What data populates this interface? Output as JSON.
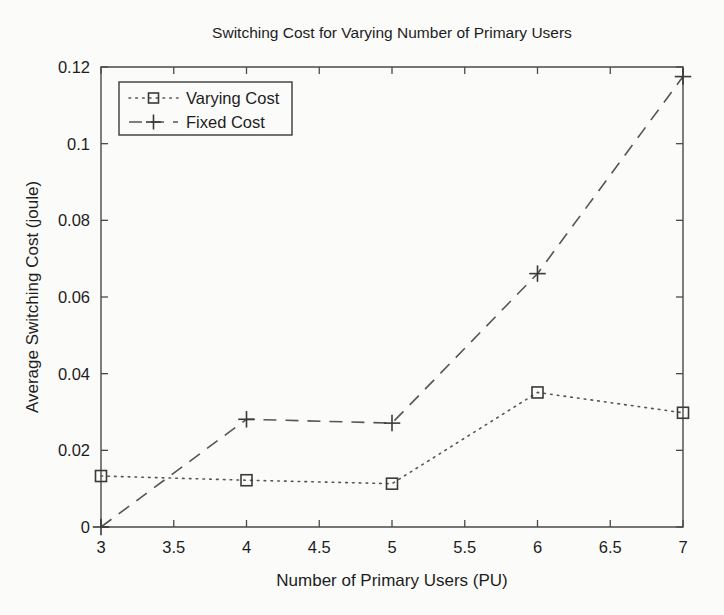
{
  "chart_data": {
    "type": "line",
    "title": "Switching Cost for Varying Number of Primary Users",
    "xlabel": "Number of Primary Users (PU)",
    "ylabel": "Average Switching Cost (joule)",
    "x": [
      3,
      4,
      5,
      6,
      7
    ],
    "xlim": [
      3,
      7
    ],
    "ylim": [
      0,
      0.12
    ],
    "grid": false,
    "legend_position": "top-left",
    "xticks": [
      "3",
      "3.5",
      "4",
      "4.5",
      "5",
      "5.5",
      "6",
      "6.5",
      "7"
    ],
    "xtick_values": [
      3,
      3.5,
      4,
      4.5,
      5,
      5.5,
      6,
      6.5,
      7
    ],
    "yticks": [
      "0",
      "0.02",
      "0.04",
      "0.06",
      "0.08",
      "0.1",
      "0.12"
    ],
    "ytick_values": [
      0,
      0.02,
      0.04,
      0.06,
      0.08,
      0.1,
      0.12
    ],
    "series": [
      {
        "name": "Varying Cost",
        "marker": "square",
        "linestyle": "dotted",
        "color": "#555555",
        "values": [
          0.0133,
          0.0122,
          0.0113,
          0.0351,
          0.0298
        ]
      },
      {
        "name": "Fixed Cost",
        "marker": "plus",
        "linestyle": "dashed",
        "color": "#555555",
        "values": [
          0.0,
          0.0281,
          0.0271,
          0.0661,
          0.1175
        ]
      }
    ]
  },
  "figure": {
    "background_color": "#fbfbfa",
    "axis_color": "#4a4a4a",
    "text_color": "#1d1d1d"
  }
}
